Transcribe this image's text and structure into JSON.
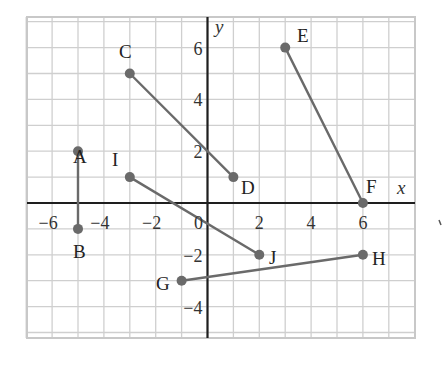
{
  "figure": {
    "type": "coordinate-plane",
    "x_axis_label": "x",
    "y_axis_label": "y",
    "x_ticks": [
      {
        "value": -6,
        "label": "−6"
      },
      {
        "value": -4,
        "label": "−4"
      },
      {
        "value": -2,
        "label": "−2"
      },
      {
        "value": 0,
        "label": "0"
      },
      {
        "value": 2,
        "label": "2"
      },
      {
        "value": 4,
        "label": "4"
      },
      {
        "value": 6,
        "label": "6"
      }
    ],
    "y_ticks": [
      {
        "value": 6,
        "label": "6"
      },
      {
        "value": 4,
        "label": "4"
      },
      {
        "value": 2,
        "label": "2"
      },
      {
        "value": -2,
        "label": "−2"
      },
      {
        "value": -4,
        "label": "−4"
      }
    ],
    "grid": {
      "x_min": -7,
      "x_max": 8,
      "y_min": -5.2,
      "y_max": 7.2,
      "step": 1
    },
    "colors": {
      "grid": "#cfcfcf",
      "axis": "#1e1e1e",
      "segment": "#6a6a6a",
      "text": "#222222"
    },
    "points": [
      {
        "name": "A",
        "x": -5,
        "y": 2
      },
      {
        "name": "B",
        "x": -5,
        "y": -1
      },
      {
        "name": "C",
        "x": -3,
        "y": 5
      },
      {
        "name": "D",
        "x": 1,
        "y": 1
      },
      {
        "name": "E",
        "x": 3,
        "y": 6
      },
      {
        "name": "F",
        "x": 6,
        "y": 0
      },
      {
        "name": "I",
        "x": -3,
        "y": 1
      },
      {
        "name": "J",
        "x": 2,
        "y": -2
      },
      {
        "name": "G",
        "x": -1,
        "y": -3
      },
      {
        "name": "H",
        "x": 6,
        "y": -2
      }
    ],
    "segments": [
      {
        "from": "A",
        "to": "B"
      },
      {
        "from": "C",
        "to": "D"
      },
      {
        "from": "E",
        "to": "F"
      },
      {
        "from": "I",
        "to": "J"
      },
      {
        "from": "G",
        "to": "H"
      }
    ]
  },
  "chart_data": {
    "type": "scatter",
    "title": "",
    "xlabel": "x",
    "ylabel": "y",
    "xlim": [
      -7,
      8
    ],
    "ylim": [
      -5,
      7
    ],
    "grid": true,
    "series": [
      {
        "name": "AB",
        "points": [
          [
            -5,
            2
          ],
          [
            -5,
            -1
          ]
        ]
      },
      {
        "name": "CD",
        "points": [
          [
            -3,
            5
          ],
          [
            1,
            1
          ]
        ]
      },
      {
        "name": "EF",
        "points": [
          [
            3,
            6
          ],
          [
            6,
            0
          ]
        ]
      },
      {
        "name": "IJ",
        "points": [
          [
            -3,
            1
          ],
          [
            2,
            -2
          ]
        ]
      },
      {
        "name": "GH",
        "points": [
          [
            -1,
            -3
          ],
          [
            6,
            -2
          ]
        ]
      }
    ],
    "x_tick_labels": [
      "-6",
      "-4",
      "-2",
      "0",
      "2",
      "4",
      "6"
    ],
    "y_tick_labels": [
      "6",
      "4",
      "2",
      "-2",
      "-4"
    ]
  },
  "labels": {
    "A": "A",
    "B": "B",
    "C": "C",
    "D": "D",
    "E": "E",
    "F": "F",
    "G": "G",
    "H": "H",
    "I": "I",
    "J": "J"
  }
}
